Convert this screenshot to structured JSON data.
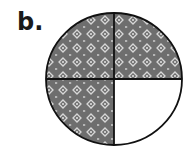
{
  "figure": {
    "label": "b.",
    "total_parts": 4,
    "shaded_parts": 3,
    "parts": [
      {
        "position": "top-left",
        "shaded": true
      },
      {
        "position": "top-right",
        "shaded": true
      },
      {
        "position": "bottom-left",
        "shaded": true
      },
      {
        "position": "bottom-right",
        "shaded": false
      }
    ],
    "colors": {
      "shade": "#6e6e6e",
      "pattern": "#d8d8d8",
      "outline": "#111111",
      "unshaded": "#ffffff"
    }
  }
}
